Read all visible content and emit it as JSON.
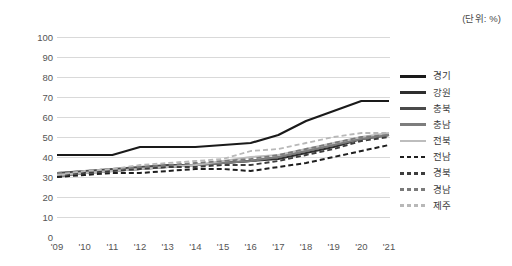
{
  "unit_note": "(단위: %)",
  "axis": {
    "y_ticks": [
      "100",
      "90",
      "80",
      "70",
      "60",
      "50",
      "40",
      "30",
      "20",
      "10",
      "0"
    ],
    "x_ticks": [
      "'09",
      "'10",
      "'11",
      "'12",
      "'13",
      "'14",
      "'15",
      "'16",
      "'17",
      "'18",
      "'19",
      "'20",
      "'21"
    ]
  },
  "legend": {
    "items": [
      {
        "label": "경기",
        "color": "#1a1a1a",
        "dash": "solid",
        "width": 2.2
      },
      {
        "label": "강원",
        "color": "#2e2e2e",
        "dash": "solid",
        "width": 2.0
      },
      {
        "label": "충북",
        "color": "#4a4a4a",
        "dash": "solid",
        "width": 1.9
      },
      {
        "label": "충남",
        "color": "#7d7d7d",
        "dash": "solid",
        "width": 1.8
      },
      {
        "label": "전북",
        "color": "#bdbdbd",
        "dash": "solid",
        "width": 1.8
      },
      {
        "label": "전남",
        "color": "#1f1f1f",
        "dash": "dashed",
        "width": 2.0
      },
      {
        "label": "경북",
        "color": "#3d3d3d",
        "dash": "dashed",
        "width": 1.9
      },
      {
        "label": "경남",
        "color": "#7a7a7a",
        "dash": "dashed",
        "width": 1.8
      },
      {
        "label": "제주",
        "color": "#b8b8b8",
        "dash": "dashed",
        "width": 1.8
      }
    ]
  },
  "chart_data": {
    "type": "line",
    "title": "",
    "subtitle": "",
    "xlabel": "",
    "ylabel": "",
    "unit": "%",
    "grid": true,
    "legend_position": "right",
    "ylim": [
      0,
      100
    ],
    "ytick_step": 10,
    "categories": [
      "'09",
      "'10",
      "'11",
      "'12",
      "'13",
      "'14",
      "'15",
      "'16",
      "'17",
      "'18",
      "'19",
      "'20",
      "'21"
    ],
    "series": [
      {
        "name": "경기",
        "values": [
          41,
          41,
          41,
          45,
          45,
          45,
          46,
          47,
          51,
          58,
          63,
          68,
          68
        ]
      },
      {
        "name": "강원",
        "values": [
          31,
          32,
          33,
          34,
          35,
          36,
          37,
          38,
          39,
          42,
          45,
          49,
          51
        ]
      },
      {
        "name": "충북",
        "values": [
          32,
          33,
          34,
          35,
          36,
          36,
          37,
          38,
          40,
          43,
          46,
          49,
          51
        ]
      },
      {
        "name": "충남",
        "values": [
          30,
          32,
          33,
          34,
          35,
          36,
          37,
          38,
          40,
          43,
          46,
          49,
          51
        ]
      },
      {
        "name": "전북",
        "values": [
          31,
          32,
          33,
          34,
          35,
          36,
          38,
          40,
          41,
          44,
          47,
          50,
          52
        ]
      },
      {
        "name": "전남",
        "values": [
          30,
          31,
          32,
          32,
          33,
          34,
          34,
          33,
          35,
          37,
          40,
          43,
          46
        ]
      },
      {
        "name": "경북",
        "values": [
          31,
          32,
          33,
          34,
          35,
          35,
          36,
          36,
          38,
          41,
          44,
          48,
          50
        ]
      },
      {
        "name": "경남",
        "values": [
          32,
          33,
          34,
          35,
          36,
          37,
          38,
          39,
          41,
          44,
          47,
          50,
          51
        ]
      },
      {
        "name": "제주",
        "values": [
          31,
          33,
          34,
          36,
          37,
          38,
          39,
          43,
          44,
          47,
          50,
          52,
          52
        ]
      }
    ]
  }
}
